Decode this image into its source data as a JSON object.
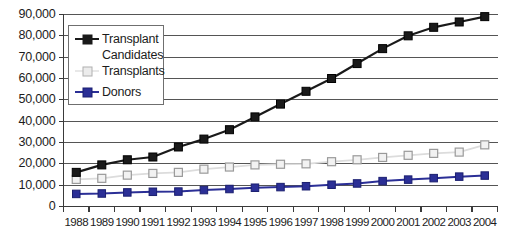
{
  "chart_data": {
    "type": "line",
    "title": "",
    "subtitle": "",
    "xlabel": "",
    "ylabel": "",
    "categories": [
      "1988",
      "1989",
      "1990",
      "1991",
      "1992",
      "1993",
      "1994",
      "1995",
      "1996",
      "1997",
      "1998",
      "1999",
      "2000",
      "2001",
      "2002",
      "2003",
      "2004"
    ],
    "ylim": [
      0,
      90000
    ],
    "ytick_labels": [
      "0",
      "10,000",
      "20,000",
      "30,000",
      "40,000",
      "50,000",
      "60,000",
      "70,000",
      "80,000",
      "90,000"
    ],
    "ytick_values": [
      0,
      10000,
      20000,
      30000,
      40000,
      50000,
      60000,
      70000,
      80000,
      90000
    ],
    "grid": "horizontal",
    "legend_position": "upper-left-inside",
    "series": [
      {
        "name": "Transplant Candidates",
        "legend_label_line1": "Transplant",
        "legend_label_line2": "Candidates",
        "color": "#1a1a1a",
        "marker": "filled-square",
        "values": [
          16000,
          19500,
          21900,
          23200,
          27900,
          31600,
          36000,
          42000,
          48000,
          54000,
          60000,
          67000,
          74000,
          80000,
          84000,
          86500,
          89000
        ]
      },
      {
        "name": "Transplants",
        "legend_label_line1": "Transplants",
        "legend_label_line2": "",
        "color": "#bdbdbd",
        "marker": "open-square",
        "values": [
          12700,
          13200,
          14700,
          15500,
          16000,
          17500,
          18500,
          19500,
          19800,
          20000,
          21000,
          21900,
          23000,
          24000,
          24900,
          25500,
          28900
        ]
      },
      {
        "name": "Donors",
        "legend_label_line1": "Donors",
        "legend_label_line2": "",
        "color": "#2b2f96",
        "marker": "filled-square",
        "values": [
          5900,
          6100,
          6600,
          6900,
          7000,
          7700,
          8200,
          8800,
          9100,
          9500,
          10200,
          10800,
          11900,
          12600,
          13300,
          14000,
          14500
        ]
      }
    ]
  },
  "axis": {
    "y_axis_name": "y-axis",
    "x_axis_name": "x-axis"
  }
}
